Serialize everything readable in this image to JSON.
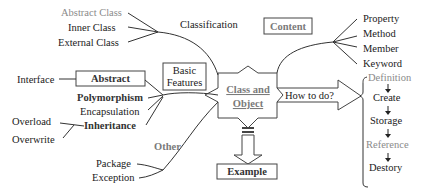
{
  "center": {
    "line1": "Class and",
    "line2": "Object"
  },
  "classification": {
    "label": "Classification",
    "items": [
      "Abstract Class",
      "Inner Class",
      "External Class"
    ]
  },
  "basic_features": {
    "line1": "Basic",
    "line2": "Features",
    "abstract_box": "Abstract",
    "interface": "Interface",
    "items": [
      "Polymorphism",
      "Encapsulation",
      "Inheritance"
    ],
    "inheritance_subitems": [
      "Overload",
      "Overwrite"
    ]
  },
  "content": {
    "label": "Content",
    "items": [
      "Property",
      "Method",
      "Member",
      "Keyword"
    ]
  },
  "how_to_do": {
    "label": "How to do?",
    "steps": [
      "Definition",
      "Create",
      "Storage",
      "Reference",
      "Destory"
    ]
  },
  "other": {
    "label": "Other",
    "items": [
      "Package",
      "Exception"
    ]
  },
  "example": {
    "label": "Example"
  },
  "colors": {
    "line": "#333333",
    "gray_text": "#8a8a8a",
    "text": "#1a1a1a"
  }
}
